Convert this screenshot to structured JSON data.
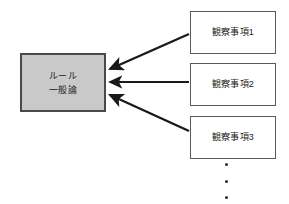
{
  "diagram": {
    "title_text": "",
    "background_color": "#ffffff",
    "conclusion": {
      "id": "conclusion-node",
      "line1": "ルール",
      "line2": "一般論",
      "fill_color": "#c9c9c9",
      "border_color": "#4a4a4a"
    },
    "observations": [
      {
        "id": "observation-1",
        "label": "観察事項1"
      },
      {
        "id": "observation-2",
        "label": "観察事項2"
      },
      {
        "id": "observation-3",
        "label": "観察事項3"
      }
    ],
    "continuation": {
      "name": "vertical-ellipsis",
      "dots": [
        "•",
        "•",
        "•"
      ]
    },
    "arrows": [
      {
        "name": "arrow-observation-1-to-conclusion",
        "from": "observation-1",
        "to": "conclusion-node",
        "direction": "down-left",
        "color": "#1a1a1a"
      },
      {
        "name": "arrow-observation-2-to-conclusion",
        "from": "observation-2",
        "to": "conclusion-node",
        "direction": "left",
        "color": "#1a1a1a"
      },
      {
        "name": "arrow-observation-3-to-conclusion",
        "from": "observation-3",
        "to": "conclusion-node",
        "direction": "up-left",
        "color": "#1a1a1a"
      }
    ]
  }
}
